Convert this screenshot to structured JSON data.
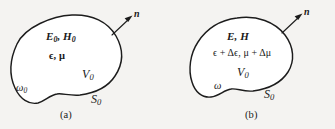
{
  "figure": {
    "background_color": "#f4f3f1",
    "ink_color": "#1c1c1c",
    "panel_count": 2
  },
  "panels": [
    {
      "id": "a",
      "caption": "(a)",
      "normal_label": "n",
      "field_label": "E",
      "field_label_sub": "0",
      "field_label_2": "H",
      "field_label_2_sub": "0",
      "field_line": "E0, H0",
      "material_line": "ϵ, μ",
      "material_epsilon": "ϵ",
      "material_mu": "μ",
      "material_separator": ",",
      "volume_label": "V",
      "volume_sub": "0",
      "surface_label": "S",
      "surface_sub": "0",
      "omega_label": "ω",
      "omega_sub": "0"
    },
    {
      "id": "b",
      "caption": "(b)",
      "normal_label": "n",
      "field_label": "E",
      "field_label_2": "H",
      "field_line": "E, H",
      "material_line": "ϵ + Δϵ, μ + Δμ",
      "material_epsilon": "ϵ + Δϵ",
      "material_mu": "μ + Δμ",
      "material_separator": ",",
      "volume_label": "V",
      "volume_sub": "0",
      "surface_label": "S",
      "surface_sub": "0",
      "omega_label": "ω",
      "omega_sub": ""
    }
  ]
}
